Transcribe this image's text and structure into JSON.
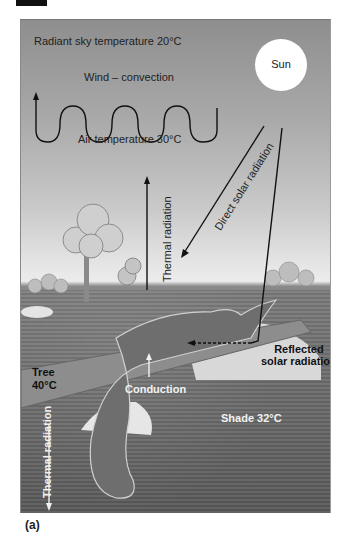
{
  "figure": {
    "panel_label": "(a)",
    "labels": {
      "sky_temperature": "Radiant sky temperature 20°C",
      "sun": "Sun",
      "wind": "Wind – convection",
      "air_temperature": "Air temperature 30°C",
      "thermal_radiation_up": "Thermal radiation",
      "direct_solar": "Direct solar radiation",
      "reflected_line1": "Reflected",
      "reflected_line2": "solar radiation",
      "tree_line1": "Tree",
      "tree_line2": "40°C",
      "conduction": "Conduction",
      "shade": "Shade 32°C",
      "thermal_radiation_down": "Thermal radiation"
    },
    "colors": {
      "sky_top": "#8e8e8e",
      "horizon": "#ececec",
      "ground": "#6c6c6c",
      "sun": "#ffffff",
      "arrow_dark": "#111111",
      "arrow_light": "#f2f2f2"
    }
  }
}
